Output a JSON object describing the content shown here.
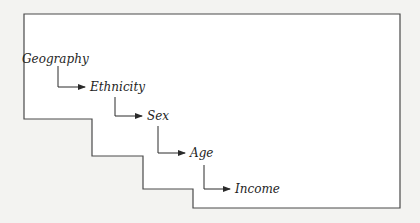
{
  "diagram": {
    "type": "hierarchical-cascade",
    "levels": [
      {
        "label": "Geography",
        "x": 22,
        "y": 54
      },
      {
        "label": "Ethnicity",
        "x": 90,
        "y": 84
      },
      {
        "label": "Sex",
        "x": 147,
        "y": 112
      },
      {
        "label": "Age",
        "x": 190,
        "y": 150
      },
      {
        "label": "Income",
        "x": 235,
        "y": 183
      }
    ],
    "colors": {
      "background": "#f3f3f1",
      "stroke": "#3a3a3a",
      "text": "#1e1e1e"
    }
  }
}
